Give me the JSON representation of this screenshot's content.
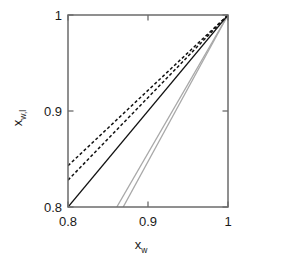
{
  "chart_data": {
    "type": "line",
    "title": "",
    "xlabel": "x_w",
    "ylabel": "x_w,l",
    "xlim": [
      0.8,
      1.0
    ],
    "ylim": [
      0.8,
      1.0
    ],
    "xticks": [
      "0.8",
      "0.9",
      "1"
    ],
    "yticks": [
      "0.8",
      "0.9",
      "1"
    ],
    "grid": false,
    "legend": "none",
    "series": [
      {
        "name": "dashed-upper",
        "style": "dashed",
        "color": "#111111",
        "x": [
          0.8,
          1.0
        ],
        "y": [
          0.843,
          1.0
        ]
      },
      {
        "name": "dashed-lower",
        "style": "dashed",
        "color": "#111111",
        "x": [
          0.8,
          1.0
        ],
        "y": [
          0.828,
          1.0
        ]
      },
      {
        "name": "solid-diagonal",
        "style": "solid",
        "color": "#111111",
        "x": [
          0.8,
          1.0
        ],
        "y": [
          0.8,
          1.0
        ]
      },
      {
        "name": "gray-left",
        "style": "solid",
        "color": "#a8a8a8",
        "x": [
          0.861,
          1.0
        ],
        "y": [
          0.8,
          1.0
        ]
      },
      {
        "name": "gray-right",
        "style": "solid",
        "color": "#a8a8a8",
        "x": [
          0.869,
          1.0
        ],
        "y": [
          0.8,
          1.0
        ]
      }
    ]
  },
  "axes": {
    "x_label_base": "x",
    "x_label_sub": "w",
    "y_label_base": "x",
    "y_label_sub": "w,l"
  },
  "ticks": {
    "x_min": "0.8",
    "x_mid": "0.9",
    "x_max": "1",
    "y_min": "0.8",
    "y_mid": "0.9",
    "y_max": "1"
  },
  "colors": {
    "frame": "#6b6b6b",
    "ink": "#111111",
    "gray_curve": "#a8a8a8",
    "background": "#ffffff"
  }
}
